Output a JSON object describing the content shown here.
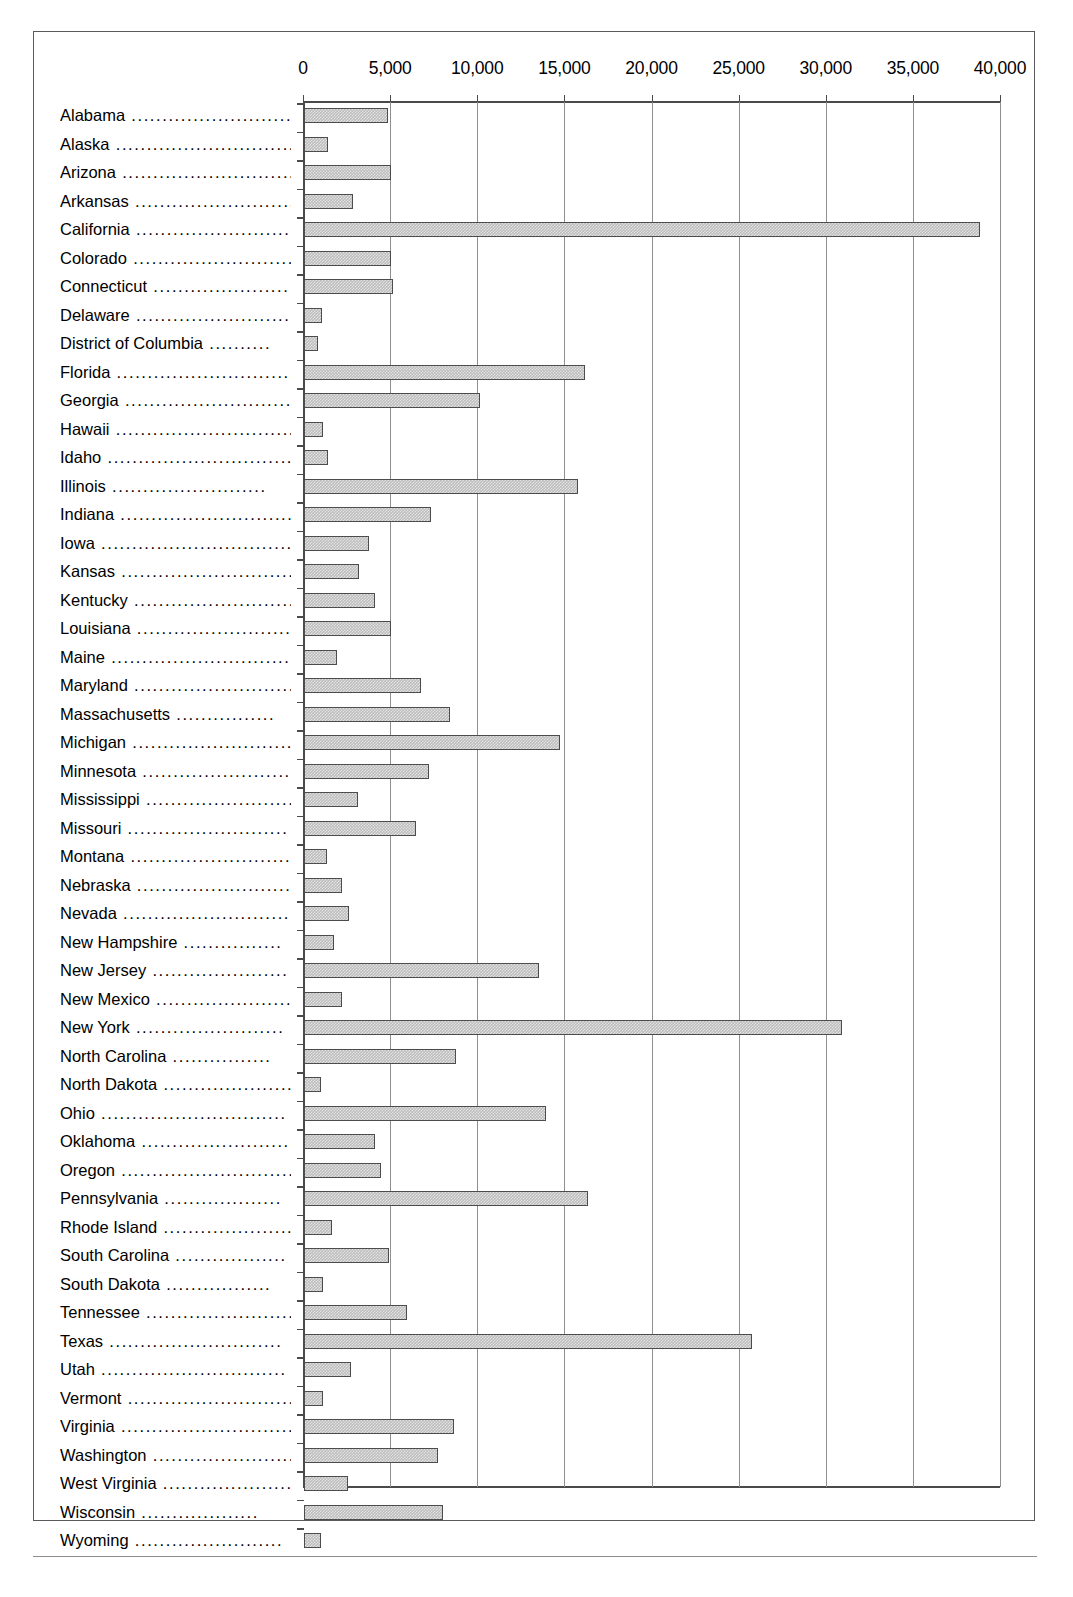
{
  "chart_data": {
    "type": "bar",
    "orientation": "horizontal",
    "title": "",
    "xlabel": "",
    "ylabel": "",
    "xlim": [
      0,
      40000
    ],
    "grid": true,
    "legend": null,
    "axis_ticks": [
      "0",
      "5,000",
      "10,000",
      "15,000",
      "20,000",
      "25,000",
      "30,000",
      "35,000",
      "40,000"
    ],
    "axis_tick_values": [
      0,
      5000,
      10000,
      15000,
      20000,
      25000,
      30000,
      35000,
      40000
    ],
    "categories": [
      "Alabama",
      "Alaska",
      "Arizona",
      "Arkansas",
      "California",
      "Colorado",
      "Connecticut",
      "Delaware",
      "District of Columbia",
      "Florida",
      "Georgia",
      "Hawaii",
      "Idaho",
      "Illinois",
      "Indiana",
      "Iowa",
      "Kansas",
      "Kentucky",
      "Louisiana",
      "Maine",
      "Maryland",
      "Massachusetts",
      "Michigan",
      "Minnesota",
      "Mississippi",
      "Missouri",
      "Montana",
      "Nebraska",
      "Nevada",
      "New Hampshire",
      "New Jersey",
      "New Mexico",
      "New York",
      "North Carolina",
      "North Dakota",
      "Ohio",
      "Oklahoma",
      "Oregon",
      "Pennsylvania",
      "Rhode Island",
      "South Carolina",
      "South Dakota",
      "Tennessee",
      "Texas",
      "Utah",
      "Vermont",
      "Virginia",
      "Washington",
      "West Virginia",
      "Wisconsin",
      "Wyoming"
    ],
    "values": [
      4800,
      1400,
      5000,
      2800,
      38800,
      5000,
      5100,
      1050,
      800,
      16100,
      10100,
      1100,
      1400,
      15700,
      7300,
      3750,
      3150,
      4050,
      5000,
      1900,
      6700,
      8400,
      14700,
      7200,
      3100,
      6400,
      1300,
      2200,
      2600,
      1700,
      13500,
      2200,
      30900,
      8700,
      950,
      13900,
      4100,
      4400,
      16300,
      1600,
      4900,
      1100,
      5900,
      25700,
      2700,
      1100,
      8600,
      7700,
      2500,
      8000,
      1000
    ],
    "leaders": [
      "..........................",
      "..............................",
      "...............................",
      "............................",
      ".........................",
      "...........................",
      "......................",
      "............................",
      "..........",
      "..............................",
      "............................",
      "..............................",
      "..............................",
      ".........................",
      "............................",
      ".................................",
      "..............................",
      "...........................",
      ".........................",
      "..............................",
      "..........................",
      "................",
      "..........................",
      "........................",
      "........................",
      "..........................",
      "...........................",
      ".........................",
      "..............................",
      "................",
      "......................",
      "......................",
      "........................",
      "................",
      "......................",
      "..............................",
      ".........................",
      "............................",
      "...................",
      "......................",
      "..................",
      ".................",
      "........................",
      "............................",
      "..............................",
      "..............................",
      "............................",
      "............................",
      "......................",
      "...................",
      "........................",
      "........................."
    ]
  }
}
